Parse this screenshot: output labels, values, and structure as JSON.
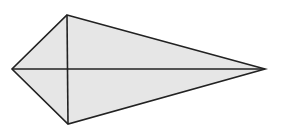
{
  "diagram": {
    "type": "kite",
    "vertices": {
      "top": [
        67,
        15
      ],
      "right": [
        265,
        69
      ],
      "bottom": [
        68,
        124
      ],
      "left": [
        12,
        69
      ]
    },
    "diagonals": [
      {
        "from": "left",
        "to": "right"
      },
      {
        "from": "top",
        "to": "bottom"
      }
    ],
    "intersection": [
      68,
      69
    ],
    "labels": []
  },
  "colors": {
    "fill": "#e6e6e6",
    "stroke": "#222222",
    "background": "#ffffff"
  }
}
